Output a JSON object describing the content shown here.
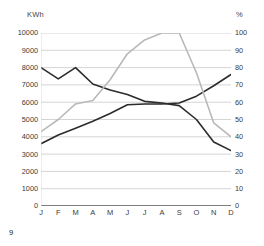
{
  "folio": "9",
  "axes": {
    "left_unit": "KWh",
    "right_unit": "%"
  },
  "chart_data": {
    "type": "line",
    "title": "",
    "xlabel": "",
    "ylabel": "KWh",
    "y2label": "%",
    "grid": true,
    "legend": "none",
    "categories": [
      "J",
      "F",
      "M",
      "A",
      "M",
      "J",
      "J",
      "A",
      "S",
      "O",
      "N",
      "D"
    ],
    "ylim": [
      0,
      10000
    ],
    "y2lim": [
      0,
      100
    ],
    "yticks": [
      0,
      1000,
      2000,
      3000,
      4000,
      5000,
      6000,
      7000,
      8000,
      9000,
      10000
    ],
    "ytick_labels": [
      "0",
      "1000",
      "2000",
      "3000",
      "4000",
      "5000",
      "6000",
      "7000",
      "8000",
      "9000",
      "10000"
    ],
    "y2ticks": [
      0,
      10,
      20,
      30,
      40,
      50,
      60,
      70,
      80,
      90,
      100
    ],
    "y2tick_labels": [
      "0",
      "10",
      "20",
      "30",
      "40",
      "50",
      "60",
      "70",
      "80",
      "90",
      "100"
    ],
    "series": [
      {
        "name": "declining-consumption",
        "axis": "left",
        "color": "#2b2b2b",
        "width": 1.6,
        "values": [
          8000,
          7350,
          8000,
          7050,
          6700,
          6450,
          6050,
          5950,
          5800,
          5000,
          3700,
          3200
        ]
      },
      {
        "name": "rising-consumption",
        "axis": "left",
        "color": "#2b2b2b",
        "width": 1.6,
        "values": [
          3600,
          4100,
          4500,
          4900,
          5350,
          5850,
          5900,
          5900,
          5950,
          6350,
          6950,
          7600
        ]
      },
      {
        "name": "efficiency-percent",
        "axis": "right",
        "color": "#b9b9b9",
        "width": 1.6,
        "values": [
          43,
          50,
          59,
          61,
          73,
          88,
          96,
          100,
          100,
          77,
          48,
          40
        ]
      }
    ]
  }
}
